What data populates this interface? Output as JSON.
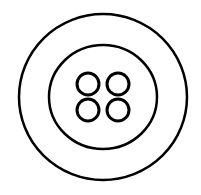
{
  "illustration": {
    "subject": "button-icon",
    "stroke_color": "#000000",
    "background_color": "#ffffff",
    "outer_rim": {
      "cx": 103,
      "cy": 97,
      "rx": 84,
      "ry": 83,
      "stroke_width": 2.5
    },
    "inner_ring": {
      "cx": 103,
      "cy": 97,
      "rx": 54,
      "ry": 52,
      "stroke_width": 2.5
    },
    "holes": [
      {
        "cx": 88,
        "cy": 84,
        "r": 11
      },
      {
        "cx": 118,
        "cy": 84,
        "r": 11
      },
      {
        "cx": 88,
        "cy": 110,
        "r": 11
      },
      {
        "cx": 118,
        "cy": 110,
        "r": 11
      }
    ]
  }
}
